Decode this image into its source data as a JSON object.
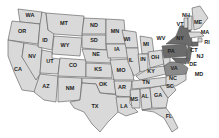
{
  "map": {
    "title": "",
    "colors": {
      "default_fill": "#d9d9d9",
      "highlight_fill": "#6b6b6b",
      "border": "#555555"
    },
    "states": [
      {
        "abbr": "WA",
        "x": 30,
        "y": 17
      },
      {
        "abbr": "OR",
        "x": 22,
        "y": 33
      },
      {
        "abbr": "CA",
        "x": 18,
        "y": 71
      },
      {
        "abbr": "NV",
        "x": 32,
        "y": 58
      },
      {
        "abbr": "ID",
        "x": 45,
        "y": 42
      },
      {
        "abbr": "MT",
        "x": 64,
        "y": 25
      },
      {
        "abbr": "WY",
        "x": 65,
        "y": 47
      },
      {
        "abbr": "UT",
        "x": 50,
        "y": 63
      },
      {
        "abbr": "AZ",
        "x": 46,
        "y": 88
      },
      {
        "abbr": "CO",
        "x": 73,
        "y": 67
      },
      {
        "abbr": "NM",
        "x": 70,
        "y": 90
      },
      {
        "abbr": "ND",
        "x": 94,
        "y": 27
      },
      {
        "abbr": "SD",
        "x": 94,
        "y": 42
      },
      {
        "abbr": "NE",
        "x": 96,
        "y": 56
      },
      {
        "abbr": "KS",
        "x": 98,
        "y": 71
      },
      {
        "abbr": "OK",
        "x": 103,
        "y": 86
      },
      {
        "abbr": "TX",
        "x": 95,
        "y": 108
      },
      {
        "abbr": "MN",
        "x": 115,
        "y": 33
      },
      {
        "abbr": "IA",
        "x": 117,
        "y": 51
      },
      {
        "abbr": "MO",
        "x": 121,
        "y": 72
      },
      {
        "abbr": "AR",
        "x": 122,
        "y": 89
      },
      {
        "abbr": "LA",
        "x": 124,
        "y": 108
      },
      {
        "abbr": "WI",
        "x": 127,
        "y": 41
      },
      {
        "abbr": "IL",
        "x": 131,
        "y": 62
      },
      {
        "abbr": "MI",
        "x": 146,
        "y": 46
      },
      {
        "abbr": "IN",
        "x": 143,
        "y": 61
      },
      {
        "abbr": "OH",
        "x": 155,
        "y": 59
      },
      {
        "abbr": "KY",
        "x": 151,
        "y": 73
      },
      {
        "abbr": "TN",
        "x": 146,
        "y": 84
      },
      {
        "abbr": "MS",
        "x": 134,
        "y": 101
      },
      {
        "abbr": "AL",
        "x": 145,
        "y": 98
      },
      {
        "abbr": "GA",
        "x": 158,
        "y": 97
      },
      {
        "abbr": "FL",
        "x": 169,
        "y": 118
      },
      {
        "abbr": "SC",
        "x": 170,
        "y": 88
      },
      {
        "abbr": "NC",
        "x": 173,
        "y": 80
      },
      {
        "abbr": "VA",
        "x": 174,
        "y": 70
      },
      {
        "abbr": "WV",
        "x": 161,
        "y": 40
      },
      {
        "abbr": "PA",
        "x": 171,
        "y": 53
      },
      {
        "abbr": "NY",
        "x": 180,
        "y": 40
      },
      {
        "abbr": "VT",
        "x": 180,
        "y": 26
      },
      {
        "abbr": "NH",
        "x": 186,
        "y": 17
      },
      {
        "abbr": "ME",
        "x": 198,
        "y": 24
      },
      {
        "abbr": "MA",
        "x": 205,
        "y": 34
      },
      {
        "abbr": "RI",
        "x": 207,
        "y": 44
      },
      {
        "abbr": "CT",
        "x": 194,
        "y": 52
      },
      {
        "abbr": "NJ",
        "x": 200,
        "y": 58
      },
      {
        "abbr": "DE",
        "x": 193,
        "y": 66
      },
      {
        "abbr": "MD",
        "x": 199,
        "y": 76
      }
    ],
    "highlighted": [
      "NY",
      "PA",
      "NJ",
      "CT",
      "MD",
      "DE",
      "VA"
    ]
  }
}
